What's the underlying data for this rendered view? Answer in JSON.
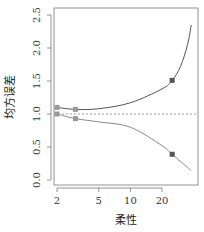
{
  "chart_data": {
    "type": "line",
    "title": "",
    "xlabel": "柔性",
    "ylabel": "均方误差",
    "xscale": "log",
    "xlim": [
      1.9,
      40
    ],
    "ylim": [
      0.0,
      2.5
    ],
    "x_ticks": [
      2,
      5,
      10,
      20
    ],
    "x_tick_labels": [
      "2",
      "5",
      "10",
      "20"
    ],
    "y_ticks": [
      0.0,
      0.5,
      1.0,
      1.5,
      2.0,
      2.5
    ],
    "y_tick_labels": [
      "0.0",
      "0.5",
      "1.0",
      "1.5",
      "2.0",
      "2.5"
    ],
    "grid": false,
    "legend": null,
    "reference_line": {
      "y": 1.0,
      "style": "dotted",
      "color": "#888888"
    },
    "series": [
      {
        "name": "upper",
        "color": "#555555",
        "x": [
          2,
          3,
          5,
          10,
          20,
          25,
          30,
          35,
          38
        ],
        "values": [
          1.1,
          1.07,
          1.08,
          1.17,
          1.38,
          1.51,
          1.72,
          2.05,
          2.35
        ],
        "markers": [
          {
            "x": 2,
            "y": 1.1,
            "color": "#999999"
          },
          {
            "x": 3,
            "y": 1.07,
            "color": "#999999"
          },
          {
            "x": 25,
            "y": 1.51,
            "color": "#555555"
          }
        ]
      },
      {
        "name": "lower",
        "color": "#888888",
        "x": [
          2,
          3,
          5,
          10,
          20,
          25,
          30,
          35,
          38
        ],
        "values": [
          1.0,
          0.93,
          0.88,
          0.8,
          0.52,
          0.39,
          0.28,
          0.19,
          0.14
        ],
        "markers": [
          {
            "x": 2,
            "y": 1.0,
            "color": "#999999"
          },
          {
            "x": 3,
            "y": 0.93,
            "color": "#999999"
          },
          {
            "x": 25,
            "y": 0.39,
            "color": "#555555"
          }
        ]
      }
    ]
  }
}
